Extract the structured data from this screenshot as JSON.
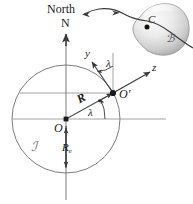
{
  "figure": {
    "labels": {
      "north": "North",
      "north_axis": "N",
      "origin": "O",
      "surface_point": "O′",
      "y_axis": "y",
      "z_axis": "z",
      "lat_angle_upper": "λ",
      "lat_angle_lower": "λ",
      "position_vector": "R",
      "earth_radius": "R",
      "earth_radius_sub": "e",
      "body_point": "C",
      "body_frame": "ℬ",
      "inertial_frame": "ℐ"
    },
    "colors": {
      "stroke": "#3a3a3a",
      "thin_stroke": "#6e6e6e",
      "text": "#1a1a1a",
      "blob_light": "#f2f2f2",
      "blob_mid": "#cfcfcf",
      "blob_dark": "#9a9a9a",
      "background": "#ffffff"
    },
    "geometry": {
      "circle_center_x": 66,
      "circle_center_y": 119,
      "circle_radius": 54,
      "surface_point_x": 113,
      "surface_point_y": 93,
      "latitude_degrees": 29
    }
  }
}
